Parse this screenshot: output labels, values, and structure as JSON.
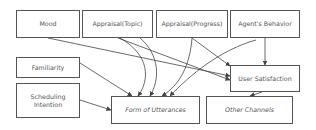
{
  "diagram": {
    "nodes": [
      {
        "id": "mood",
        "label": "Mood"
      },
      {
        "id": "appraisal_topic",
        "label": "Appraisal(Topic)"
      },
      {
        "id": "appraisal_progress",
        "label": "Appraisal(Progress)"
      },
      {
        "id": "agents_behavior",
        "label": "Agent's Behavior"
      },
      {
        "id": "familiarity",
        "label": "Familiarity"
      },
      {
        "id": "scheduling_intention",
        "label": "Scheduling Intention"
      },
      {
        "id": "user_satisfaction",
        "label": "User Satisfaction"
      },
      {
        "id": "form_of_utterances",
        "label": "Form of Utterances"
      },
      {
        "id": "other_channels",
        "label": "Other Channels"
      }
    ],
    "edges": [
      {
        "from": "mood",
        "to": "user_satisfaction"
      },
      {
        "from": "mood",
        "to": "form_of_utterances"
      },
      {
        "from": "appraisal_topic",
        "to": "user_satisfaction"
      },
      {
        "from": "appraisal_topic",
        "to": "form_of_utterances"
      },
      {
        "from": "appraisal_progress",
        "to": "user_satisfaction"
      },
      {
        "from": "appraisal_progress",
        "to": "form_of_utterances"
      },
      {
        "from": "agents_behavior",
        "to": "user_satisfaction"
      },
      {
        "from": "agents_behavior",
        "to": "form_of_utterances"
      },
      {
        "from": "familiarity",
        "to": "form_of_utterances"
      },
      {
        "from": "scheduling_intention",
        "to": "form_of_utterances"
      },
      {
        "from": "user_satisfaction",
        "to": "other_channels"
      }
    ]
  }
}
